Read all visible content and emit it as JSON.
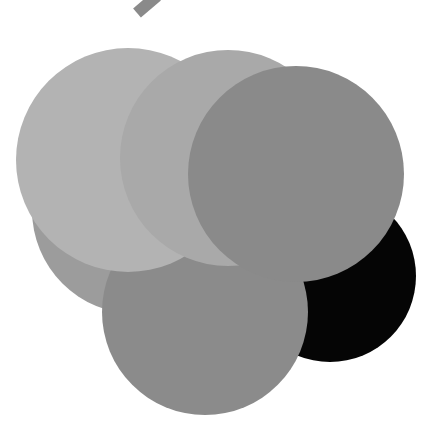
{
  "figure": {
    "type": "overlapping-circles",
    "background": "#ffffff",
    "tab": {
      "x1": 137,
      "y1": 13,
      "x2": 157,
      "y2": -4,
      "width": 12,
      "color": "#8a8a8a"
    },
    "circles": [
      {
        "id": "black",
        "cx": 330,
        "cy": 276,
        "r": 86,
        "color": "#050505"
      },
      {
        "id": "left-medium",
        "cx": 136,
        "cy": 210,
        "r": 104,
        "color": "#9c9c9c"
      },
      {
        "id": "bottom",
        "cx": 205,
        "cy": 312,
        "r": 103,
        "color": "#8b8b8b"
      },
      {
        "id": "top-left",
        "cx": 128,
        "cy": 160,
        "r": 112,
        "color": "#b3b3b3"
      },
      {
        "id": "top-middle",
        "cx": 228,
        "cy": 158,
        "r": 108,
        "color": "#a9a9a9"
      },
      {
        "id": "right-large",
        "cx": 296,
        "cy": 174,
        "r": 108,
        "color": "#8a8a8a"
      }
    ]
  }
}
